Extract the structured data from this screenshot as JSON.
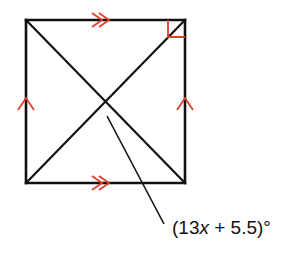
{
  "diagram": {
    "shape": "rectangle with diagonals",
    "angle_label": {
      "open": "(13",
      "var": "x",
      "rest": " + 5.5)°"
    },
    "marks": {
      "parallel_top_bottom": "double-arrow",
      "parallel_left_right": "single-arrow",
      "right_angle": "top-right corner"
    },
    "colors": {
      "lines": "#111111",
      "marks": "#d9412b"
    }
  }
}
